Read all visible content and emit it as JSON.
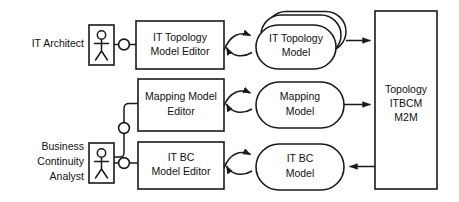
{
  "diagram": {
    "type": "block-diagram",
    "background_color": "#ffffff",
    "stroke_color": "#1a1a1a",
    "actors": [
      {
        "id": "it-architect",
        "label_lines": [
          "IT Architect"
        ],
        "label_line_1": "IT Architect"
      },
      {
        "id": "business-continuity-analyst",
        "label_lines": [
          "Business",
          "Continuity",
          "Analyst"
        ],
        "label_line_1": "Business",
        "label_line_2": "Continuity",
        "label_line_3": "Analyst"
      }
    ],
    "editors": [
      {
        "id": "it-topology-model-editor",
        "label_line_1": "IT Topology",
        "label_line_2": "Model Editor"
      },
      {
        "id": "mapping-model-editor",
        "label_line_1": "Mapping Model",
        "label_line_2": "Editor"
      },
      {
        "id": "it-bc-model-editor",
        "label_line_1": "IT BC",
        "label_line_2": "Model Editor"
      }
    ],
    "models": [
      {
        "id": "it-topology-model",
        "label_line_1": "IT Topology",
        "label_line_2": "Model",
        "stacked": "true"
      },
      {
        "id": "mapping-model",
        "label_line_1": "Mapping",
        "label_line_2": "Model",
        "stacked": "false"
      },
      {
        "id": "it-bc-model",
        "label_line_1": "IT BC",
        "label_line_2": "Model",
        "stacked": "false"
      }
    ],
    "transform": {
      "id": "topology-itbcm-m2m",
      "label_line_1": "Topology",
      "label_line_2": "ITBCM",
      "label_line_3": "M2M"
    },
    "edges": [
      {
        "id": "topology-model-to-m2m",
        "direction": "right",
        "from": "it-topology-model",
        "to": "topology-itbcm-m2m"
      },
      {
        "id": "mapping-model-to-m2m",
        "direction": "right",
        "from": "mapping-model",
        "to": "topology-itbcm-m2m"
      },
      {
        "id": "m2m-to-it-bc-model",
        "direction": "left",
        "from": "topology-itbcm-m2m",
        "to": "it-bc-model"
      }
    ]
  }
}
